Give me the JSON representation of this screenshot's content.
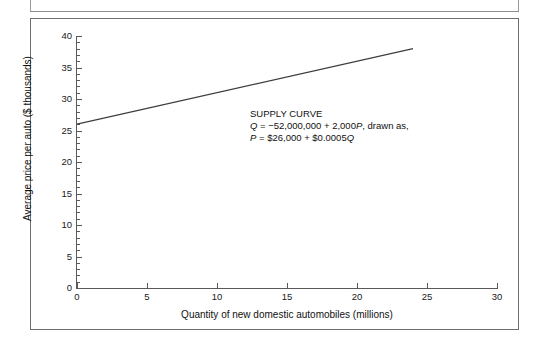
{
  "figure": {
    "background_color": "#ffffff",
    "frame_color": "#6f6f6f",
    "axis_color": "#595959",
    "text_color": "#111111",
    "line_color": "#3d3d3d"
  },
  "annotation": {
    "heading": "SUPPLY CURVE",
    "equation_quantity_prefix": "Q",
    "equation_quantity_body": " = −52,000,000 + 2,000",
    "equation_quantity_var": "P",
    "equation_quantity_suffix": ", drawn as,",
    "equation_price_prefix": "P",
    "equation_price_body": " = $26,000 + $0.0005",
    "equation_price_var": "Q"
  },
  "chart_data": {
    "type": "line",
    "title": "",
    "xlabel": "Quantity of new domestic automobiles (millions)",
    "ylabel": "Average price per auto ($ thousands)",
    "xlim": [
      0,
      30
    ],
    "ylim": [
      0,
      40
    ],
    "xticks": [
      0,
      5,
      10,
      15,
      20,
      25,
      30
    ],
    "yticks": [
      0,
      5,
      10,
      15,
      20,
      25,
      30,
      35,
      40
    ],
    "yticks_minor": [
      1,
      2,
      3,
      4,
      6,
      7,
      8,
      9,
      11,
      12,
      13,
      14,
      16,
      17,
      18,
      19,
      21,
      22,
      23,
      24,
      26,
      27,
      28,
      29,
      31,
      32,
      33,
      34,
      36,
      37,
      38,
      39
    ],
    "grid": false,
    "legend": false,
    "series": [
      {
        "name": "Supply curve",
        "x": [
          0,
          24
        ],
        "y": [
          26,
          38
        ]
      }
    ],
    "equation": "P = $26,000 + $0.0005Q",
    "equation_inverse": "Q = -52,000,000 + 2,000P",
    "xtick_labels": [
      "0",
      "5",
      "10",
      "15",
      "20",
      "25",
      "30"
    ],
    "ytick_labels": [
      "0",
      "5",
      "10",
      "15",
      "20",
      "25",
      "30",
      "35",
      "40"
    ]
  }
}
